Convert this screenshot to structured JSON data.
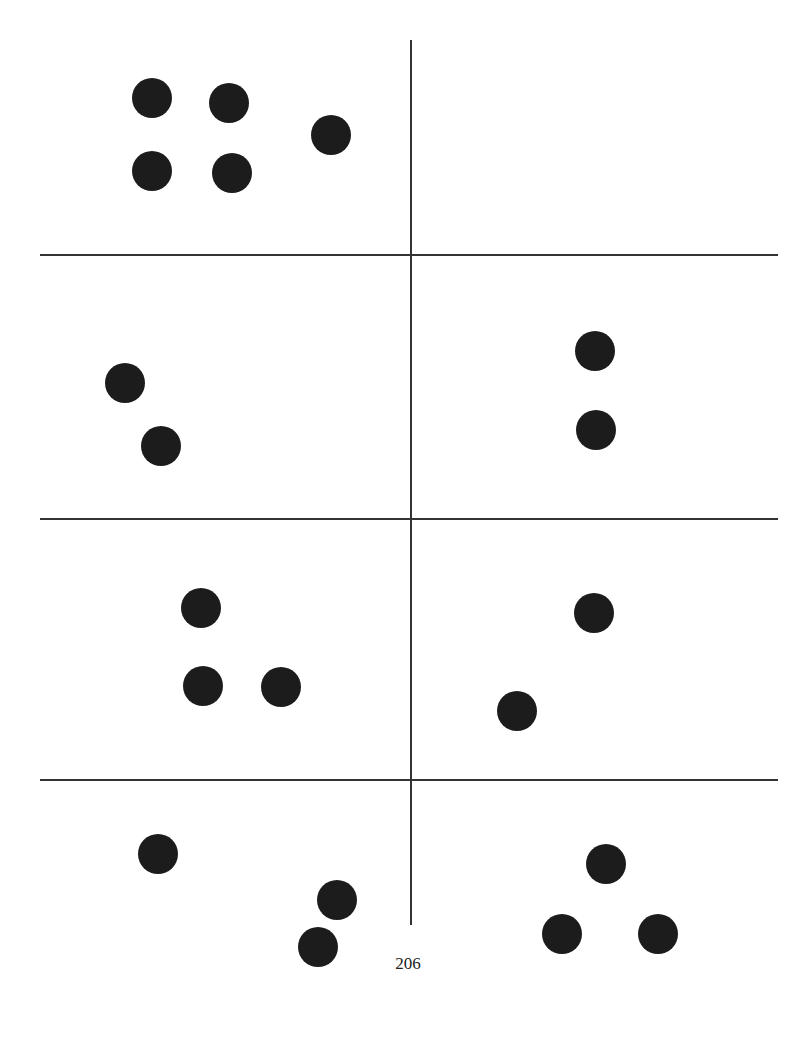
{
  "page": {
    "number": "206",
    "grid": {
      "rows": 4,
      "cols": 2,
      "line_color": "#333333",
      "dot_color": "#1c1c1c"
    },
    "cells": [
      {
        "id": "row1-left",
        "dot_count": 5,
        "dots": [
          [
            152,
            98
          ],
          [
            229,
            103
          ],
          [
            331,
            135
          ],
          [
            152,
            171
          ],
          [
            232,
            173
          ]
        ]
      },
      {
        "id": "row1-right",
        "dot_count": 0,
        "dots": []
      },
      {
        "id": "row2-left",
        "dot_count": 2,
        "dots": [
          [
            125,
            383
          ],
          [
            161,
            446
          ]
        ]
      },
      {
        "id": "row2-right",
        "dot_count": 2,
        "dots": [
          [
            595,
            351
          ],
          [
            596,
            430
          ]
        ]
      },
      {
        "id": "row3-left",
        "dot_count": 3,
        "dots": [
          [
            201,
            608
          ],
          [
            203,
            686
          ],
          [
            281,
            687
          ]
        ]
      },
      {
        "id": "row3-right",
        "dot_count": 2,
        "dots": [
          [
            594,
            613
          ],
          [
            517,
            711
          ]
        ]
      },
      {
        "id": "row4-left",
        "dot_count": 3,
        "dots": [
          [
            158,
            854
          ],
          [
            337,
            900
          ],
          [
            318,
            947
          ]
        ]
      },
      {
        "id": "row4-right",
        "dot_count": 3,
        "dots": [
          [
            606,
            864
          ],
          [
            562,
            934
          ],
          [
            658,
            934
          ]
        ]
      }
    ]
  }
}
